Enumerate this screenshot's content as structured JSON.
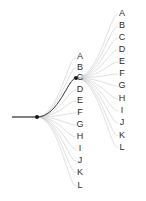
{
  "figure": {
    "background_color": "#ffffff",
    "width": 146,
    "height": 201
  },
  "style": {
    "edge_color": "#c9c9c9",
    "highlight_color": "#333333",
    "stem_color": "#2b2b2b",
    "node_color": "#1a1a1a",
    "label_color": "#2b2b2b",
    "edge_width": 0.6,
    "highlight_width": 1.0
  },
  "root": {
    "label": "",
    "x": 37,
    "y": 117,
    "stem_start_x": 12,
    "stem_end_x": 37
  },
  "highlight": {
    "from": "root",
    "to_level": "level1",
    "to_label": "C"
  },
  "level1": {
    "name": "first-fan",
    "origin_x": 37,
    "origin_y": 117,
    "label_x": 80,
    "nodes": [
      {
        "label": "A",
        "x": 76,
        "y": 57,
        "highlighted": false
      },
      {
        "label": "B",
        "x": 76,
        "y": 68,
        "highlighted": false
      },
      {
        "label": "C",
        "x": 76,
        "y": 78,
        "highlighted": true
      },
      {
        "label": "D",
        "x": 76,
        "y": 90,
        "highlighted": false
      },
      {
        "label": "E",
        "x": 76,
        "y": 101,
        "highlighted": false
      },
      {
        "label": "F",
        "x": 76,
        "y": 113,
        "highlighted": false
      },
      {
        "label": "G",
        "x": 76,
        "y": 125,
        "highlighted": false
      },
      {
        "label": "H",
        "x": 76,
        "y": 137,
        "highlighted": false
      },
      {
        "label": "I",
        "x": 76,
        "y": 149,
        "highlighted": false
      },
      {
        "label": "J",
        "x": 76,
        "y": 161,
        "highlighted": false
      },
      {
        "label": "K",
        "x": 76,
        "y": 173,
        "highlighted": false
      },
      {
        "label": "L",
        "x": 76,
        "y": 186,
        "highlighted": false
      }
    ]
  },
  "level2": {
    "name": "second-fan",
    "origin_x": 76,
    "origin_y": 78,
    "label_x": 122,
    "nodes": [
      {
        "label": "A",
        "x": 118,
        "y": 14
      },
      {
        "label": "B",
        "x": 118,
        "y": 26
      },
      {
        "label": "C",
        "x": 118,
        "y": 38
      },
      {
        "label": "D",
        "x": 118,
        "y": 50
      },
      {
        "label": "E",
        "x": 118,
        "y": 62
      },
      {
        "label": "F",
        "x": 118,
        "y": 74
      },
      {
        "label": "G",
        "x": 118,
        "y": 86
      },
      {
        "label": "H",
        "x": 118,
        "y": 99
      },
      {
        "label": "I",
        "x": 118,
        "y": 111
      },
      {
        "label": "J",
        "x": 118,
        "y": 123
      },
      {
        "label": "K",
        "x": 118,
        "y": 136
      },
      {
        "label": "L",
        "x": 118,
        "y": 148
      }
    ]
  }
}
